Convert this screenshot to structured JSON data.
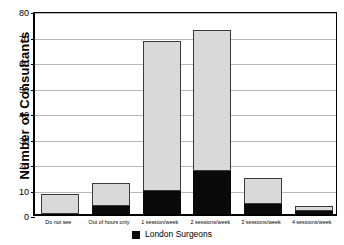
{
  "chart_data": {
    "type": "bar",
    "subtype": "stacked",
    "title": "",
    "xlabel": "",
    "ylabel": "Number of Consultants",
    "ylim": [
      0,
      80
    ],
    "yticks": [
      0,
      10,
      20,
      30,
      40,
      50,
      60,
      70,
      80
    ],
    "ytick_labels": [
      "0",
      "10",
      "20",
      "30",
      "40",
      "50",
      "60",
      "70",
      "80"
    ],
    "yminor_ticks": [
      5,
      15,
      25,
      35,
      45,
      55,
      65,
      75
    ],
    "grid": "horizontal",
    "legend_position": "bottom-center",
    "categories": [
      "Do not see",
      "Out of hours only",
      "1 session/week",
      "2 sessions/week",
      "3 sessions/week",
      "4 sessions/week"
    ],
    "series": [
      {
        "name": "London Surgeons",
        "color": "#0a0a0a",
        "values": [
          0,
          3,
          9,
          17,
          4,
          1
        ]
      },
      {
        "name": "Other",
        "color": "#d9d9d9",
        "values": [
          8,
          9,
          59,
          55,
          10,
          2
        ]
      }
    ],
    "totals": [
      8,
      12,
      68,
      72,
      14,
      3
    ]
  },
  "axis": {
    "y_title": "Number of Consultants",
    "y_tick_labels": [
      "80",
      "70",
      "60",
      "50",
      "40",
      "30",
      "20",
      "10",
      "0"
    ]
  },
  "categories": [
    {
      "label": "Do not see",
      "total": 8,
      "dark": 0,
      "light": 8
    },
    {
      "label": "Out of hours only",
      "total": 12,
      "dark": 3,
      "light": 9
    },
    {
      "label": "1 session/week",
      "total": 68,
      "dark": 9,
      "light": 59
    },
    {
      "label": "2 sessions/week",
      "total": 72,
      "dark": 17,
      "light": 55
    },
    {
      "label": "3 sessions/week",
      "total": 14,
      "dark": 4,
      "light": 10
    },
    {
      "label": "4 sessions/week",
      "total": 3,
      "dark": 1,
      "light": 2
    }
  ],
  "legend": {
    "items": [
      {
        "label": "London Surgeons",
        "color": "#0a0a0a",
        "swatch": "filled-square-icon"
      }
    ]
  },
  "colors": {
    "bar_dark": "#0a0a0a",
    "bar_light": "#d9d9d9",
    "bar_outline": "#3a3a3a",
    "grid": "#b9b9b9",
    "axis": "#000000",
    "background": "#ffffff"
  }
}
